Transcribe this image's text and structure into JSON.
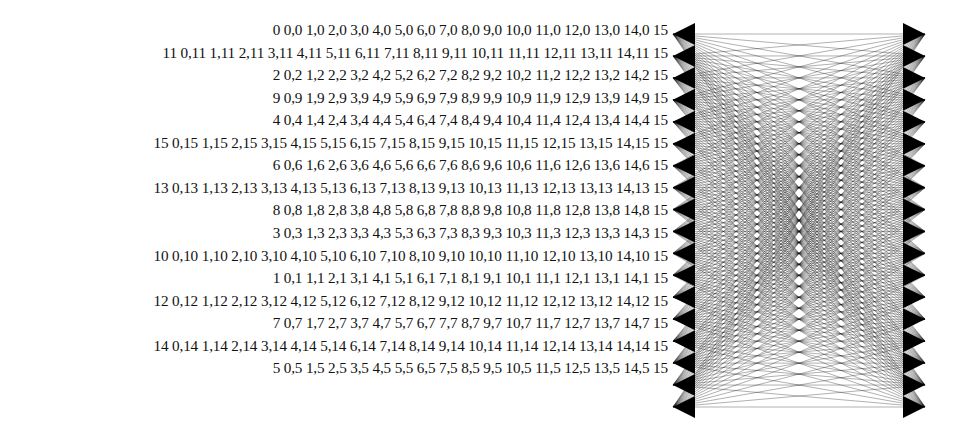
{
  "page": {
    "background_color": "#ffffff",
    "text_color": "#111111",
    "width": 971,
    "height": 432
  },
  "label_list": {
    "name": "node-pair-label-list",
    "align": "right",
    "row_count": 16,
    "rows": [
      {
        "index": 0,
        "node": "0",
        "text": "0 0,0 1,0 2,0 3,0 4,0 5,0 6,0 7,0 8,0 9,0 10,0 11,0 12,0 13,0 14,0 15"
      },
      {
        "index": 1,
        "node": "11",
        "text": "11 0,11 1,11 2,11 3,11 4,11 5,11 6,11 7,11 8,11 9,11 10,11 11,11 12,11 13,11 14,11 15"
      },
      {
        "index": 2,
        "node": "2",
        "text": "2 0,2 1,2 2,2 3,2 4,2 5,2 6,2 7,2 8,2 9,2 10,2 11,2 12,2 13,2 14,2 15"
      },
      {
        "index": 3,
        "node": "9",
        "text": "9 0,9 1,9 2,9 3,9 4,9 5,9 6,9 7,9 8,9 9,9 10,9 11,9 12,9 13,9 14,9 15"
      },
      {
        "index": 4,
        "node": "4",
        "text": "4 0,4 1,4 2,4 3,4 4,4 5,4 6,4 7,4 8,4 9,4 10,4 11,4 12,4 13,4 14,4 15"
      },
      {
        "index": 5,
        "node": "15",
        "text": "15 0,15 1,15 2,15 3,15 4,15 5,15 6,15 7,15 8,15 9,15 10,15 11,15 12,15 13,15 14,15 15"
      },
      {
        "index": 6,
        "node": "6",
        "text": "6 0,6 1,6 2,6 3,6 4,6 5,6 6,6 7,6 8,6 9,6 10,6 11,6 12,6 13,6 14,6 15"
      },
      {
        "index": 7,
        "node": "13",
        "text": "13 0,13 1,13 2,13 3,13 4,13 5,13 6,13 7,13 8,13 9,13 10,13 11,13 12,13 13,13 14,13 15"
      },
      {
        "index": 8,
        "node": "8",
        "text": "8 0,8 1,8 2,8 3,8 4,8 5,8 6,8 7,8 8,8 9,8 10,8 11,8 12,8 13,8 14,8 15"
      },
      {
        "index": 9,
        "node": "3",
        "text": "3 0,3 1,3 2,3 3,3 4,3 5,3 6,3 7,3 8,3 9,3 10,3 11,3 12,3 13,3 14,3 15"
      },
      {
        "index": 10,
        "node": "10",
        "text": "10 0,10 1,10 2,10 3,10 4,10 5,10 6,10 7,10 8,10 9,10 10,10 11,10 12,10 13,10 14,10 15"
      },
      {
        "index": 11,
        "node": "1",
        "text": "1 0,1 1,1 2,1 3,1 4,1 5,1 6,1 7,1 8,1 9,1 10,1 11,1 12,1 13,1 14,1 15"
      },
      {
        "index": 12,
        "node": "12",
        "text": "12 0,12 1,12 2,12 3,12 4,12 5,12 6,12 7,12 8,12 9,12 10,12 11,12 12,12 13,12 14,12 15"
      },
      {
        "index": 13,
        "node": "7",
        "text": "7 0,7 1,7 2,7 3,7 4,7 5,7 6,7 7,7 8,7 9,7 10,7 11,7 12,7 13,7 14,7 15"
      },
      {
        "index": 14,
        "node": "14",
        "text": "14 0,14 1,14 2,14 3,14 4,14 5,14 6,14 7,14 8,14 9,14 10,14 11,14 12,14 13,14 14,14 15"
      },
      {
        "index": 15,
        "node": "5",
        "text": "5 0,5 1,5 2,5 3,5 4,5 5,5 6,5 7,5 8,5 9,5 10,5 11,5 12,5 13,5 14,5 15"
      }
    ]
  },
  "graph": {
    "name": "complete-bipartite-edge-drawing",
    "description": "Two vertical columns of 18 nodes joined by straight-line edges between every left node and every right node",
    "left_node_count": 18,
    "right_node_count": 18,
    "left_x": 673,
    "right_x": 925,
    "top_y": 34,
    "bottom_y": 407,
    "edge_color": "#111111",
    "node_color": "#000000",
    "edge_stroke_width": 0.38
  }
}
